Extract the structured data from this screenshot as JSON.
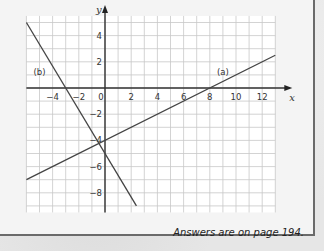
{
  "chart_data": {
    "type": "line",
    "title": "",
    "xlabel": "x",
    "ylabel": "y",
    "xlim": [
      -6,
      13
    ],
    "ylim": [
      -9.5,
      5.5
    ],
    "grid": true,
    "x_ticks": [
      -4,
      -2,
      0,
      2,
      4,
      6,
      8,
      10,
      12
    ],
    "y_ticks": [
      4,
      2,
      -2,
      -4,
      -6,
      -8
    ],
    "x_tick_labels": [
      "−4",
      "−2",
      "0",
      "2",
      "4",
      "6",
      "8",
      "10",
      "12"
    ],
    "y_tick_labels": [
      "4",
      "2",
      "−2",
      "−4",
      "−6",
      "−8"
    ],
    "series": [
      {
        "name": "(a)",
        "equation": "y = x/2 - 4",
        "x": [
          -6,
          13
        ],
        "y": [
          -7,
          2.5
        ]
      },
      {
        "name": "(b)",
        "equation": "y = -5x/3 - 5",
        "x": [
          -6,
          2.4
        ],
        "y": [
          5,
          -9
        ]
      }
    ],
    "annotations": [
      {
        "text": "(a)",
        "x": 9,
        "y": 1
      },
      {
        "text": "(b)",
        "x": -5,
        "y": 1
      }
    ]
  },
  "footer": {
    "text": "Answers are on page 194."
  }
}
